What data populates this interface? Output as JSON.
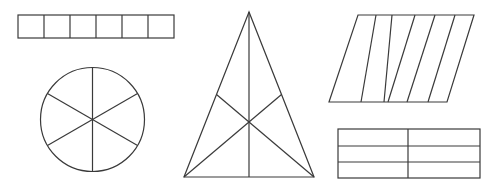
{
  "diagram": {
    "line_color": "#3a3a3a",
    "background": "#ffffff",
    "shapes": [
      {
        "id": "strip",
        "type": "rectangle",
        "parts": 6,
        "x": 18,
        "y": 15,
        "width": 156,
        "height": 23,
        "dividers_x": [
          44,
          70,
          96,
          122,
          148
        ]
      },
      {
        "id": "circle",
        "type": "circle",
        "parts": 6,
        "cx": 92.5,
        "cy": 119.5,
        "r": 52,
        "spokes_deg": [
          90,
          30,
          330,
          270,
          210,
          150
        ]
      },
      {
        "id": "triangle",
        "type": "triangle",
        "parts": 6,
        "apex": [
          249,
          12
        ],
        "base_left": [
          184,
          177
        ],
        "base_right": [
          314,
          177
        ],
        "centroid": [
          249,
          110
        ],
        "medians": [
          [
            [
              249,
              12
            ],
            [
              249,
              177
            ]
          ],
          [
            [
              184,
              177
            ],
            [
              281.5,
              94.5
            ]
          ],
          [
            [
              314,
              177
            ],
            [
              216.5,
              94.5
            ]
          ]
        ]
      },
      {
        "id": "parallelogram",
        "type": "parallelogram",
        "parts": 6,
        "top_y": 15,
        "bottom_y": 102,
        "top_points_x": [
          358,
          376,
          392,
          415,
          435,
          455,
          474
        ],
        "bottom_points_x": [
          329,
          361,
          384,
          388,
          407,
          428,
          447
        ]
      },
      {
        "id": "grid",
        "type": "rectangle",
        "parts": 6,
        "x": 338,
        "y": 129,
        "width": 142,
        "height": 49,
        "rows_y": [
          146,
          162
        ],
        "col_x": [
          408
        ]
      }
    ]
  }
}
